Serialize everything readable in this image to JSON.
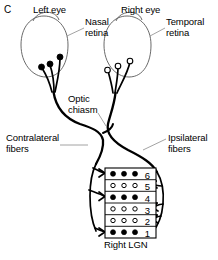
{
  "figure": {
    "panel_letter": "C",
    "caption_labels": {
      "left_eye": "Left eye",
      "right_eye": "Right eye",
      "nasal_retina": "Nasal\nretina",
      "temporal_retina": "Temporal\nretina",
      "optic_chiasm": "Optic\nchiasm",
      "contralateral_fibers": "Contralateral\nfibers",
      "ipsilateral_fibers": "Ipsilateral\nfibers",
      "right_lgn": "Right LGN"
    },
    "colors": {
      "stroke": "#000000",
      "eye_outline": "#595959",
      "leader_line": "#8c8c8c",
      "background": "#ffffff",
      "filled_dot": "#000000",
      "open_dot": "#ffffff"
    }
  },
  "lgn": {
    "title": "Right LGN",
    "layers": [
      {
        "number": "6",
        "dot_style": "filled",
        "dot_count": 3,
        "input": "contralateral"
      },
      {
        "number": "5",
        "dot_style": "open",
        "dot_count": 3,
        "input": "ipsilateral"
      },
      {
        "number": "4",
        "dot_style": "filled",
        "dot_count": 3,
        "input": "contralateral"
      },
      {
        "number": "3",
        "dot_style": "open",
        "dot_count": 3,
        "input": "ipsilateral"
      },
      {
        "number": "2",
        "dot_style": "open",
        "dot_count": 3,
        "input": "ipsilateral"
      },
      {
        "number": "1",
        "dot_style": "filled",
        "dot_count": 3,
        "input": "contralateral"
      }
    ]
  },
  "eyes": [
    {
      "name": "left_eye",
      "label": "Left eye",
      "retina_label": "Nasal\nretina",
      "ganglion_dot_style": "filled",
      "ganglion_count": 3
    },
    {
      "name": "right_eye",
      "label": "Right eye",
      "retina_label": "Temporal\nretina",
      "ganglion_dot_style": "open",
      "ganglion_count": 3
    }
  ]
}
